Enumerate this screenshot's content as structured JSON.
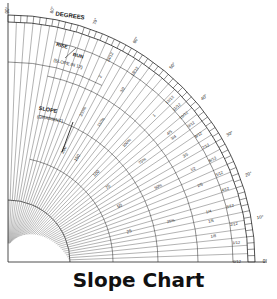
{
  "title": "Slope Chart",
  "labels": {
    "degrees": "DEGREES",
    "rise": "RISE",
    "run": "RUN",
    "slope_in_12": "(SLOPE IN 12)",
    "slope": "SLOPE",
    "gradient": "(GRADIENT)"
  },
  "degree_ticks": [
    "0°",
    "10°",
    "20°",
    "30°",
    "40°",
    "50°",
    "60°",
    "70°",
    "80°",
    "90°"
  ],
  "slope_in_12": [
    "0/12",
    "1/12",
    "2/12",
    "3/12",
    "4/12",
    "5/12",
    "6/12",
    "7/12",
    "8/12",
    "9/12",
    "10/12",
    "11/12",
    "12/12",
    "18/12",
    "24/12"
  ],
  "fractions": [
    "1/8",
    "1/5",
    "1/4",
    "2/5",
    "1/2",
    "3/5",
    "3/4",
    "4/5",
    "1",
    "3/2",
    "2"
  ],
  "percent_gradient": [
    "25%",
    "50%",
    "75%",
    "100%",
    "150%",
    "200%"
  ],
  "ratio_inner": [
    "25",
    "50",
    "75",
    "100",
    "150",
    "200"
  ],
  "colors": {
    "ink": "#222222",
    "background": "#ffffff"
  }
}
